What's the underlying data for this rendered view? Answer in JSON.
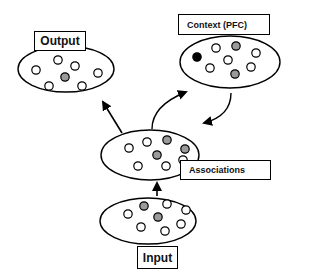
{
  "diagram": {
    "colors": {
      "stroke": "#000000",
      "empty_node": "#ffffff",
      "active_node": "#9a9a9a",
      "context_node": "#000000"
    },
    "layers": [
      {
        "id": "output",
        "label": "Output",
        "ellipse": {
          "cx": 66,
          "cy": 69,
          "rx": 48,
          "ry": 23
        },
        "nodes": [
          {
            "x": 58,
            "y": 60,
            "state": "empty"
          },
          {
            "x": 75,
            "y": 66,
            "state": "empty"
          },
          {
            "x": 36,
            "y": 70,
            "state": "empty"
          },
          {
            "x": 98,
            "y": 73,
            "state": "empty"
          },
          {
            "x": 65,
            "y": 77,
            "state": "active"
          },
          {
            "x": 49,
            "y": 86,
            "state": "empty"
          },
          {
            "x": 82,
            "y": 86,
            "state": "empty"
          }
        ]
      },
      {
        "id": "context",
        "label": "Context (PFC)",
        "ellipse": {
          "cx": 230,
          "cy": 62,
          "rx": 50,
          "ry": 26
        },
        "nodes": [
          {
            "x": 216,
            "y": 48,
            "state": "empty"
          },
          {
            "x": 236,
            "y": 46,
            "state": "active"
          },
          {
            "x": 256,
            "y": 53,
            "state": "empty"
          },
          {
            "x": 197,
            "y": 57,
            "state": "context"
          },
          {
            "x": 228,
            "y": 60,
            "state": "empty"
          },
          {
            "x": 210,
            "y": 68,
            "state": "empty"
          },
          {
            "x": 251,
            "y": 67,
            "state": "empty"
          },
          {
            "x": 235,
            "y": 74,
            "state": "active"
          }
        ]
      },
      {
        "id": "associations",
        "label": "Associations",
        "ellipse": {
          "cx": 150,
          "cy": 155,
          "rx": 49,
          "ry": 25
        },
        "nodes": [
          {
            "x": 147,
            "y": 142,
            "state": "empty"
          },
          {
            "x": 167,
            "y": 140,
            "state": "active"
          },
          {
            "x": 129,
            "y": 148,
            "state": "empty"
          },
          {
            "x": 157,
            "y": 155,
            "state": "active"
          },
          {
            "x": 185,
            "y": 149,
            "state": "active"
          },
          {
            "x": 183,
            "y": 160,
            "state": "empty"
          },
          {
            "x": 138,
            "y": 166,
            "state": "empty"
          },
          {
            "x": 166,
            "y": 166,
            "state": "empty"
          }
        ]
      },
      {
        "id": "input",
        "label": "Input",
        "ellipse": {
          "cx": 148,
          "cy": 221,
          "rx": 48,
          "ry": 23
        },
        "nodes": [
          {
            "x": 144,
            "y": 206,
            "state": "active"
          },
          {
            "x": 167,
            "y": 204,
            "state": "empty"
          },
          {
            "x": 128,
            "y": 214,
            "state": "empty"
          },
          {
            "x": 158,
            "y": 217,
            "state": "active"
          },
          {
            "x": 186,
            "y": 210,
            "state": "empty"
          },
          {
            "x": 141,
            "y": 227,
            "state": "empty"
          },
          {
            "x": 181,
            "y": 224,
            "state": "empty"
          },
          {
            "x": 165,
            "y": 231,
            "state": "empty"
          }
        ]
      }
    ],
    "arrows": [
      {
        "from": "associations",
        "to": "output",
        "type": "straight"
      },
      {
        "from": "associations",
        "to": "context",
        "type": "curved"
      },
      {
        "from": "context",
        "to": "associations",
        "type": "curved"
      },
      {
        "from": "input",
        "to": "associations",
        "type": "straight"
      }
    ]
  }
}
